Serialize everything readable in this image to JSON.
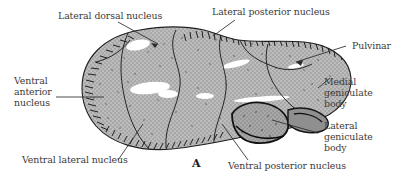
{
  "figure": {
    "panel_letter": "A",
    "background_color": "#ffffff",
    "text_color": "#3b3b3b",
    "outline_color": "#1a1a1a",
    "body_fill_color": "#a8a8a8",
    "highlight_color": "#ffffff"
  },
  "labels": {
    "lateral_dorsal": "Lateral dorsal nucleus",
    "lateral_posterior": "Lateral posterior nucleus",
    "pulvinar": "Pulvinar",
    "ventral_anterior": "Ventral\nanterior\nnucleus",
    "medial_geniculate": "Medial\ngeniculate\nbody",
    "lateral_geniculate": "Lateral\ngeniculate\nbody",
    "ventral_lateral": "Ventral lateral nucleus",
    "ventral_posterior": "Ventral posterior nucleus"
  }
}
